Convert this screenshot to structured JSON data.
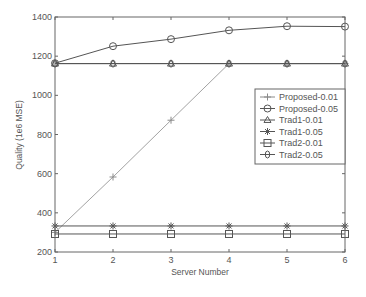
{
  "chart_data": {
    "type": "line",
    "title": "",
    "xlabel": "Server Number",
    "ylabel": "Quality (1e6 MSE)",
    "x": [
      1,
      2,
      3,
      4,
      5,
      6
    ],
    "xlim": [
      1,
      6
    ],
    "ylim": [
      200,
      1400
    ],
    "xticks": [
      "1",
      "2",
      "3",
      "4",
      "5",
      "6"
    ],
    "yticks": [
      "200",
      "400",
      "600",
      "800",
      "1000",
      "1200",
      "1400"
    ],
    "grid": false,
    "legend_position": "right-center inside",
    "series": [
      {
        "name": "Proposed-0.01",
        "marker": "plus",
        "color": "#8a8a8a",
        "values": [
          300,
          583,
          873,
          1162,
          1162,
          1162
        ]
      },
      {
        "name": "Proposed-0.05",
        "marker": "circle",
        "color": "#555555",
        "values": [
          1164,
          1251,
          1287,
          1332,
          1353,
          1351
        ]
      },
      {
        "name": "Trad1-0.01",
        "marker": "triangle",
        "color": "#555555",
        "values": [
          1162,
          1162,
          1162,
          1162,
          1162,
          1162
        ]
      },
      {
        "name": "Trad1-0.05",
        "marker": "asterisk",
        "color": "#555555",
        "values": [
          333,
          333,
          333,
          333,
          333,
          333
        ]
      },
      {
        "name": "Trad2-0.01",
        "marker": "square",
        "color": "#555555",
        "values": [
          292,
          292,
          292,
          292,
          292,
          292
        ]
      },
      {
        "name": "Trad2-0.05",
        "marker": "diamond-circle",
        "color": "#555555",
        "values": [
          1162,
          1162,
          1162,
          1162,
          1162,
          1162
        ]
      }
    ]
  }
}
